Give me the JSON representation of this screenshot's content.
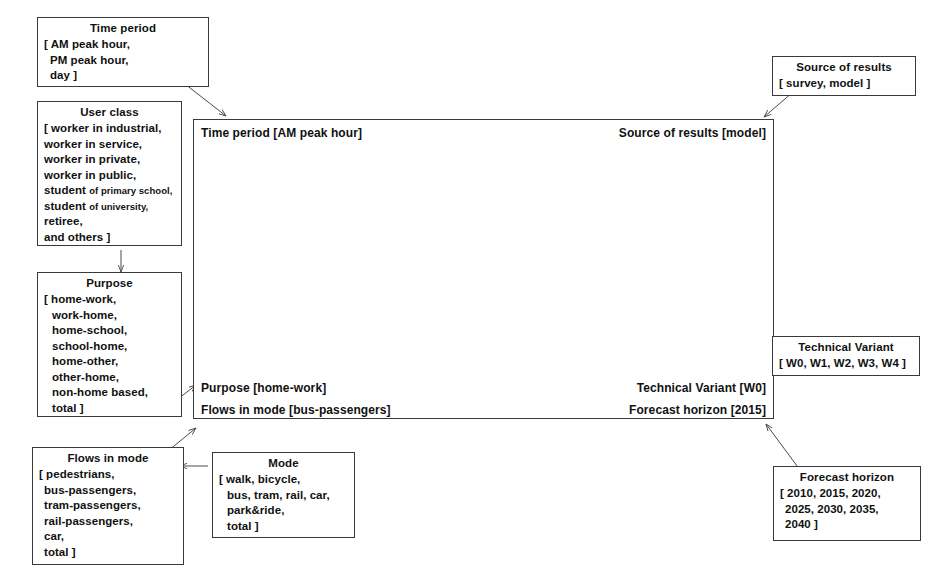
{
  "diagram": {
    "stroke_color": "#3a3a3a",
    "map_color": "#8a8a8a"
  },
  "boxes": {
    "time_period": {
      "title": "Time period",
      "lines": [
        "[ AM peak hour,",
        "PM peak hour,",
        "day ]"
      ]
    },
    "user_class": {
      "title": "User class",
      "lines": [
        "[ worker in industrial,",
        "worker in service,",
        "worker in private,",
        "worker in public,",
        "student",
        "student",
        "retiree,",
        "and others ]"
      ],
      "line5_main": "student",
      "line5_small": "of primary school,",
      "line6_main": "student",
      "line6_small": "of university,"
    },
    "purpose": {
      "title": "Purpose",
      "lines": [
        "[ home-work,",
        "work-home,",
        "home-school,",
        "school-home,",
        "home-other,",
        "other-home,",
        "non-home based,",
        "total ]"
      ]
    },
    "flows_in_mode": {
      "title": "Flows in mode",
      "lines": [
        "[ pedestrians,",
        "bus-passengers,",
        "tram-passengers,",
        "rail-passengers,",
        "car,",
        "total ]"
      ]
    },
    "mode": {
      "title": "Mode",
      "lines": [
        "[ walk, bicycle,",
        "bus, tram, rail, car,",
        "park&ride,",
        "total ]"
      ]
    },
    "source_of_results": {
      "title": "Source of results",
      "lines": [
        "[ survey, model ]"
      ]
    },
    "technical_variant": {
      "title": "Technical Variant",
      "lines": [
        "[ W0, W1, W2, W3, W4 ]"
      ]
    },
    "forecast_horizon": {
      "title": "Forecast horizon",
      "lines": [
        "[ 2010,   2015,   2020,",
        "2025,   2030,   2035,",
        "2040 ]"
      ]
    }
  },
  "panel": {
    "time_period_label": "Time period [AM peak hour]",
    "source_of_results_label": "Source of results [model]",
    "purpose_label": "Purpose [home-work]",
    "flows_in_mode_label": "Flows in mode [bus-passengers]",
    "technical_variant_label": "Technical Variant [W0]",
    "forecast_horizon_label": "Forecast horizon [2015]",
    "map_caption": "transport network assignment map"
  }
}
